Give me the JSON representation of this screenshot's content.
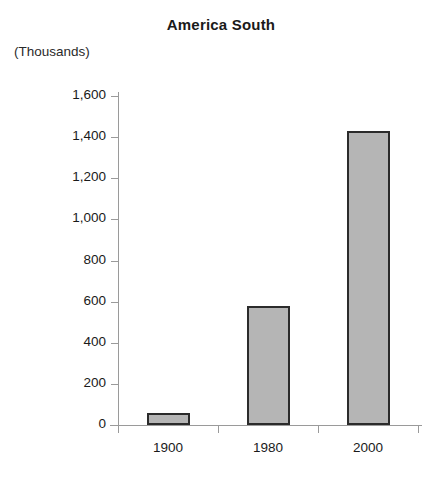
{
  "chart_data": {
    "type": "bar",
    "title": "America South",
    "subtitle": "",
    "unit_label": "(Thousands)",
    "xlabel": "",
    "ylabel": "",
    "categories": [
      "1900",
      "1980",
      "2000"
    ],
    "values": [
      60,
      580,
      1430
    ],
    "series": [
      {
        "name": "America South",
        "values": [
          60,
          580,
          1430
        ]
      }
    ],
    "ylim": [
      0,
      1600
    ],
    "ytick_values": [
      0,
      200,
      400,
      600,
      800,
      1000,
      1200,
      1400,
      1600
    ],
    "ytick_labels": [
      "0",
      "200",
      "400",
      "600",
      "800",
      "1,000",
      "1,200",
      "1,400",
      "1,600"
    ],
    "grid": false,
    "legend": false,
    "legend_position": "none",
    "bar_fill_color": "#b5b5b5",
    "bar_border_color": "#2b2b2b",
    "axis_color": "#9a9a9a",
    "background_color": "#ffffff",
    "text_color": "#1a1a1a"
  }
}
